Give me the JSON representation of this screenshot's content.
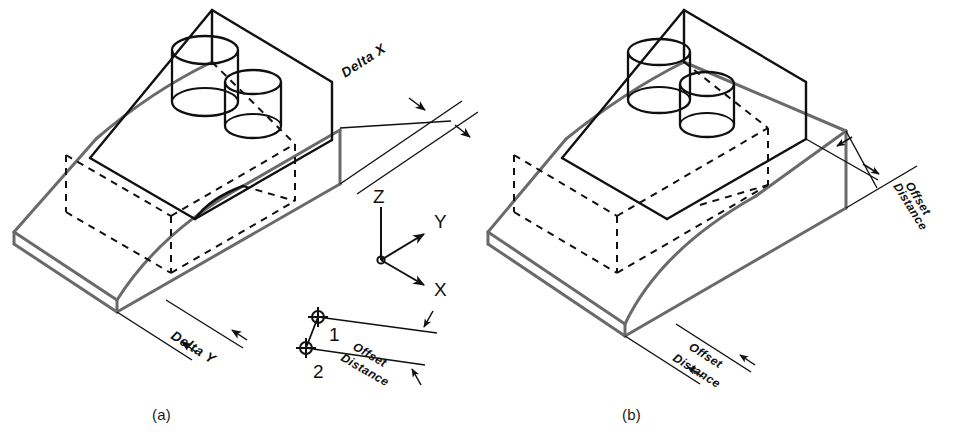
{
  "figure": {
    "background_color": "#ffffff",
    "line_color_visible": "#101010",
    "line_color_offset": "#6a6a6a",
    "line_color_hidden": "#101010",
    "panels": [
      {
        "id": "a",
        "caption": "(a)",
        "description": "Isometric view dimensioned with Delta X and Delta Y",
        "labels": [
          "Delta X",
          "Delta Y"
        ]
      },
      {
        "id": "b",
        "caption": "(b)",
        "description": "Isometric view dimensioned with two Offset Distance dimensions",
        "labels": [
          "Offset Distance",
          "Offset Distance"
        ]
      }
    ]
  },
  "dimensions": {
    "delta_x": "Delta X",
    "delta_y": "Delta Y",
    "offset_distance": "Offset Distance"
  },
  "axes": {
    "name": "coordinate-triad",
    "z": "Z",
    "y": "Y",
    "x": "X"
  },
  "detail": {
    "name": "offset-distance-detail",
    "point_1": "1",
    "point_2": "2",
    "offset_label": "Offset Distance"
  },
  "captions": {
    "a": "(a)",
    "b": "(b)"
  }
}
